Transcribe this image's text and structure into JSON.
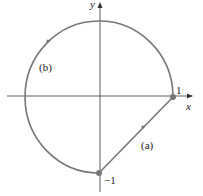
{
  "diagram": {
    "axes": {
      "x_label": "x",
      "y_label": "y"
    },
    "points": [
      {
        "label": "1",
        "x": 1,
        "y": 0
      },
      {
        "label": "−1",
        "x": 0,
        "y": -1
      }
    ],
    "paths": [
      {
        "label": "(a)",
        "description": "line segment from (0,-1) to (1,0)"
      },
      {
        "label": "(b)",
        "description": "circular arc counterclockwise from (1,0) to (0,-1)"
      }
    ],
    "colors": {
      "curve": "#777777",
      "axis": "#333333"
    }
  }
}
